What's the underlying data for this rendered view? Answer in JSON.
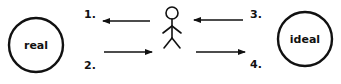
{
  "diagram": {
    "nodes": [
      {
        "id": "real",
        "label": "real"
      },
      {
        "id": "ideal",
        "label": "ideal"
      }
    ],
    "figure": "person-stick-figure",
    "arrows": [
      {
        "number": "1.",
        "direction": "left",
        "from": "person",
        "to": "real"
      },
      {
        "number": "2.",
        "direction": "right",
        "from": "real",
        "to": "person"
      },
      {
        "number": "3.",
        "direction": "left",
        "from": "ideal",
        "to": "person"
      },
      {
        "number": "4.",
        "direction": "right",
        "from": "person",
        "to": "ideal"
      }
    ],
    "colors": {
      "stroke": "#111111",
      "background": "#ffffff"
    }
  }
}
